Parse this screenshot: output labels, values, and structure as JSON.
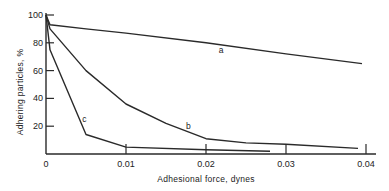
{
  "chart_data": {
    "type": "line",
    "title": "",
    "xlabel": "Adhesional force, dynes",
    "ylabel": "Adhering particles, %",
    "xlim": [
      0,
      0.04
    ],
    "ylim": [
      0,
      100
    ],
    "x_ticks": [
      {
        "value": 0,
        "label": "0"
      },
      {
        "value": 0.01,
        "label": "0.01"
      },
      {
        "value": 0.02,
        "label": "0.02"
      },
      {
        "value": 0.03,
        "label": "0.03"
      },
      {
        "value": 0.04,
        "label": "0.04"
      }
    ],
    "y_ticks": [
      {
        "value": 20,
        "label": "20"
      },
      {
        "value": 40,
        "label": "40"
      },
      {
        "value": 60,
        "label": "60"
      },
      {
        "value": 80,
        "label": "80"
      },
      {
        "value": 100,
        "label": "100"
      }
    ],
    "grid": false,
    "legend": "inline curve labels",
    "series": [
      {
        "name": "a",
        "x": [
          0,
          0.0005,
          0.005,
          0.01,
          0.02,
          0.03,
          0.0395
        ],
        "y": [
          100,
          93,
          90,
          87,
          80,
          72,
          65
        ],
        "label_pos": {
          "x": 0.0219,
          "y": 73
        }
      },
      {
        "name": "b",
        "x": [
          0,
          0.0005,
          0.005,
          0.01,
          0.015,
          0.02,
          0.025,
          0.03,
          0.039
        ],
        "y": [
          100,
          90,
          60,
          36,
          22,
          11,
          8,
          7,
          4
        ],
        "label_pos": {
          "x": 0.0178,
          "y": 18
        }
      },
      {
        "name": "c",
        "x": [
          0,
          0.0005,
          0.005,
          0.01,
          0.02,
          0.028
        ],
        "y": [
          100,
          75,
          14,
          5,
          3,
          2
        ],
        "label_pos": {
          "x": 0.0048,
          "y": 23
        }
      }
    ]
  }
}
